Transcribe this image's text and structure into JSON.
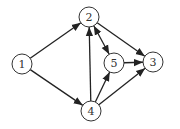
{
  "diagram": {
    "type": "directed-graph",
    "nodes": [
      {
        "id": "1",
        "label": "1",
        "x": 22,
        "y": 64
      },
      {
        "id": "2",
        "label": "2",
        "x": 89,
        "y": 17
      },
      {
        "id": "3",
        "label": "3",
        "x": 153,
        "y": 62
      },
      {
        "id": "4",
        "label": "4",
        "x": 91,
        "y": 111
      },
      {
        "id": "5",
        "label": "5",
        "x": 114,
        "y": 63
      }
    ],
    "edges": [
      {
        "from": "1",
        "to": "2",
        "bidirectional": false
      },
      {
        "from": "1",
        "to": "4",
        "bidirectional": false
      },
      {
        "from": "2",
        "to": "3",
        "bidirectional": false
      },
      {
        "from": "2",
        "to": "5",
        "bidirectional": true
      },
      {
        "from": "4",
        "to": "2",
        "bidirectional": false
      },
      {
        "from": "4",
        "to": "5",
        "bidirectional": false
      },
      {
        "from": "4",
        "to": "3",
        "bidirectional": false
      },
      {
        "from": "5",
        "to": "3",
        "bidirectional": false
      }
    ],
    "colors": {
      "stroke": "#222222",
      "fill": "#ffffff"
    }
  }
}
